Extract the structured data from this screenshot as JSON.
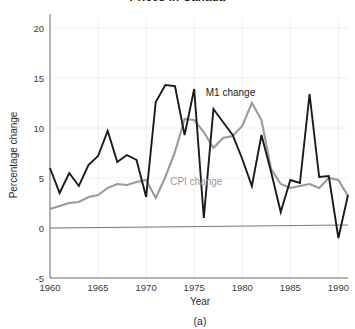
{
  "chart_data": {
    "type": "line",
    "title": "Prices in Canada",
    "subtitle": "",
    "caption": "(a)",
    "xlabel": "Year",
    "ylabel": "Percentage change",
    "xlim": [
      1960,
      1991
    ],
    "ylim": [
      -5,
      21
    ],
    "xticks": [
      1960,
      1965,
      1970,
      1975,
      1980,
      1985,
      1990
    ],
    "yticks": [
      -5,
      0,
      5,
      10,
      15,
      20
    ],
    "xtick_labels": [
      "1960",
      "1965",
      "1970",
      "1975",
      "1980",
      "1985",
      "1990"
    ],
    "ytick_labels": [
      "-5",
      "0",
      "5",
      "10",
      "15",
      "20"
    ],
    "grid": true,
    "legend_position": "inline-annotations",
    "x": [
      1960,
      1961,
      1962,
      1963,
      1964,
      1965,
      1966,
      1967,
      1968,
      1969,
      1970,
      1971,
      1972,
      1973,
      1974,
      1975,
      1976,
      1977,
      1978,
      1979,
      1980,
      1981,
      1982,
      1983,
      1984,
      1985,
      1986,
      1987,
      1988,
      1989,
      1990,
      1991
    ],
    "series": [
      {
        "name": "M1 change",
        "color": "#1a1a1a",
        "width": 1.9,
        "label_x": 1976.2,
        "label_y": 13.2,
        "values": [
          6.0,
          3.5,
          5.5,
          4.2,
          6.3,
          7.2,
          9.7,
          6.6,
          7.3,
          6.8,
          3.1,
          12.6,
          14.3,
          14.2,
          9.3,
          13.9,
          1.0,
          11.9,
          10.6,
          9.3,
          6.9,
          4.2,
          9.3,
          5.6,
          1.6,
          4.8,
          4.5,
          13.4,
          5.1,
          5.2,
          -1.0,
          3.3
        ]
      },
      {
        "name": "CPI change",
        "color": "#9a9a9a",
        "width": 2.1,
        "label_x": 1972.5,
        "label_y": 4.3,
        "values": [
          1.9,
          2.2,
          2.5,
          2.6,
          3.1,
          3.3,
          4.0,
          4.4,
          4.3,
          4.6,
          4.8,
          3.0,
          5.1,
          7.6,
          10.9,
          10.8,
          9.6,
          8.0,
          9.0,
          9.2,
          10.2,
          12.5,
          10.8,
          5.9,
          4.4,
          4.0,
          4.2,
          4.4,
          4.0,
          5.0,
          4.8,
          3.2
        ]
      }
    ]
  }
}
